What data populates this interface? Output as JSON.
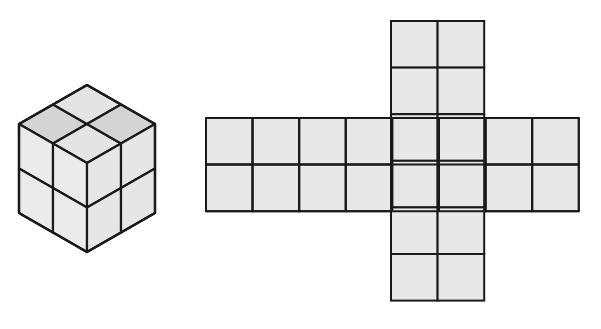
{
  "diagram": {
    "colors": {
      "background": "#ffffff",
      "face_fill": "#e8e8e8",
      "top_fill_dark": "#d4d4d4",
      "top_fill_light": "#e4e4e4",
      "left_fill": "#ebebeb",
      "right_fill": "#e6e6e6",
      "stroke": "#1a1a1a"
    },
    "cube": {
      "grid": 2,
      "vertices": {
        "top": [
          87,
          85
        ],
        "left_top": [
          19,
          124
        ],
        "right_top": [
          155,
          124
        ],
        "center": [
          87,
          163
        ],
        "left_bottom": [
          19,
          213
        ],
        "right_bottom": [
          155,
          213
        ],
        "bottom": [
          87,
          252
        ]
      }
    },
    "net": {
      "cell_size": 46.6,
      "horizontal_strip": {
        "x": 206,
        "y": 118,
        "cols": 8,
        "rows": 2
      },
      "vertical_strip": {
        "x": 391,
        "y": 21,
        "cols": 2,
        "rows": 6
      },
      "stroke_width": 2
    }
  }
}
